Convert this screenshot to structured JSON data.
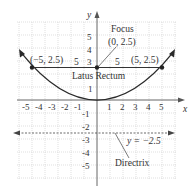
{
  "diagram": {
    "type": "parabola",
    "equation_implied": "x^2 = 10y",
    "axes": {
      "x_label": "x",
      "y_label": "y",
      "x_ticks": [
        "-5",
        "-4",
        "-3",
        "-2",
        "-1",
        "1",
        "2",
        "3",
        "4",
        "5"
      ],
      "y_ticks_positive": [
        "5",
        "4",
        "3",
        "1"
      ],
      "y_ticks_negative": [
        "-1",
        "-2",
        "-3",
        "-4",
        "-5"
      ]
    },
    "focus": {
      "title": "Focus",
      "coords": "(0, 2.5)"
    },
    "latus_rectum": {
      "label": "Latus Rectum",
      "left_point": "(−5, 2.5)",
      "right_point": "(5, 2.5)",
      "left_length": "5",
      "right_length": "5"
    },
    "directrix": {
      "label": "Directrix",
      "equation": "y = −2.5"
    },
    "colors": {
      "curve": "#2a2a2a",
      "grid": "#c8c8c8",
      "text": "#333333"
    }
  }
}
